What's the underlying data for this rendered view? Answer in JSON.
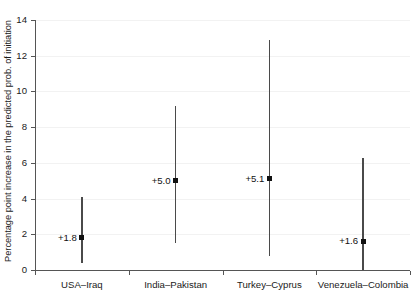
{
  "chart_data": {
    "type": "scatter",
    "title": "",
    "xlabel": "",
    "ylabel": "Percentage point increase in the predicted prob. of initiation",
    "ylim": [
      0,
      14
    ],
    "yticks": [
      0,
      2,
      4,
      6,
      8,
      10,
      12,
      14
    ],
    "ytick_labels": [
      "0",
      "2",
      "4",
      "6",
      "8",
      "10",
      "12",
      "14"
    ],
    "grid": true,
    "legend": "none",
    "categories": [
      "USA–Iraq",
      "India–Pakistan",
      "Turkey–Cyprus",
      "Venezuela–Colombia"
    ],
    "values": [
      1.8,
      5.0,
      5.1,
      1.6
    ],
    "ci_low": [
      0.4,
      1.5,
      0.8,
      0.0
    ],
    "ci_high": [
      4.1,
      9.2,
      12.9,
      6.3
    ],
    "point_labels": [
      "+1.8",
      "+5.0",
      "+5.1",
      "+1.6"
    ],
    "series": [
      {
        "name": "Predicted probability increase",
        "points": [
          {
            "category": "USA–Iraq",
            "value": 1.8,
            "label": "+1.8",
            "low": 0.4,
            "high": 4.1
          },
          {
            "category": "India–Pakistan",
            "value": 5.0,
            "label": "+5.0",
            "low": 1.5,
            "high": 9.2
          },
          {
            "category": "Turkey–Cyprus",
            "value": 5.1,
            "label": "+5.1",
            "low": 0.8,
            "high": 12.9
          },
          {
            "category": "Venezuela–Colombia",
            "value": 1.6,
            "label": "+1.6",
            "low": 0.0,
            "high": 6.3
          }
        ]
      }
    ],
    "colors": {
      "marker": "#111111",
      "errorbar": "#4a4a4a",
      "axis": "#555555",
      "grid": "#f2f2f2",
      "text": "#1a1a1a",
      "background": "#ffffff"
    }
  },
  "axes": {
    "y_title": "Percentage point increase in the predicted prob. of initiation"
  }
}
